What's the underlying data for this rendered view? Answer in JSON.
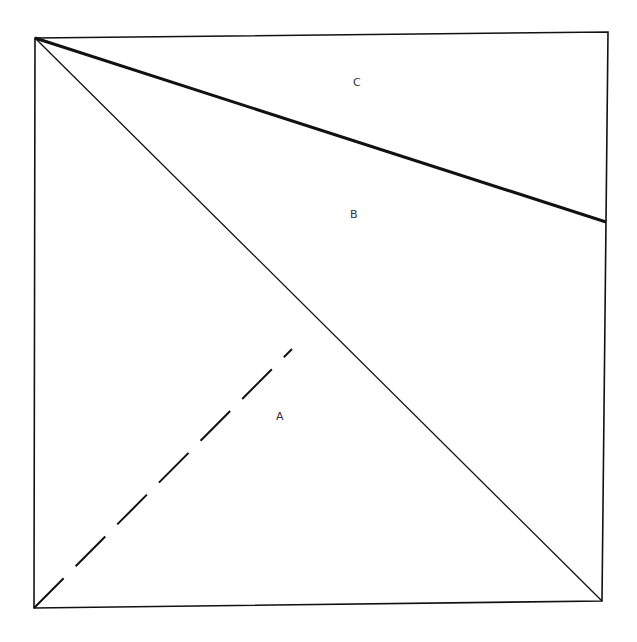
{
  "diagram": {
    "type": "square-partition",
    "colors": {
      "stroke": "#111111",
      "label": "#333333",
      "background": "#ffffff"
    },
    "square": {
      "corners": {
        "top_left": [
          35,
          38
        ],
        "top_right": [
          608,
          32
        ],
        "bottom_right": [
          602,
          601
        ],
        "bottom_left": [
          34,
          608
        ]
      }
    },
    "lines": [
      {
        "name": "diagonal",
        "from": [
          35,
          38
        ],
        "to": [
          602,
          601
        ],
        "style": "solid",
        "weight": "thin"
      },
      {
        "name": "thick-line",
        "from": [
          35,
          38
        ],
        "to": [
          606,
          222
        ],
        "style": "solid",
        "weight": "thick"
      },
      {
        "name": "dashed-line",
        "from": [
          34,
          608
        ],
        "to": [
          292,
          349
        ],
        "style": "dashed",
        "weight": "medium"
      }
    ],
    "labels": {
      "a": {
        "text": "A",
        "x": 280,
        "y": 420
      },
      "b": {
        "text": "B",
        "x": 354,
        "y": 218
      },
      "c": {
        "text": "C",
        "x": 357,
        "y": 86
      }
    }
  }
}
